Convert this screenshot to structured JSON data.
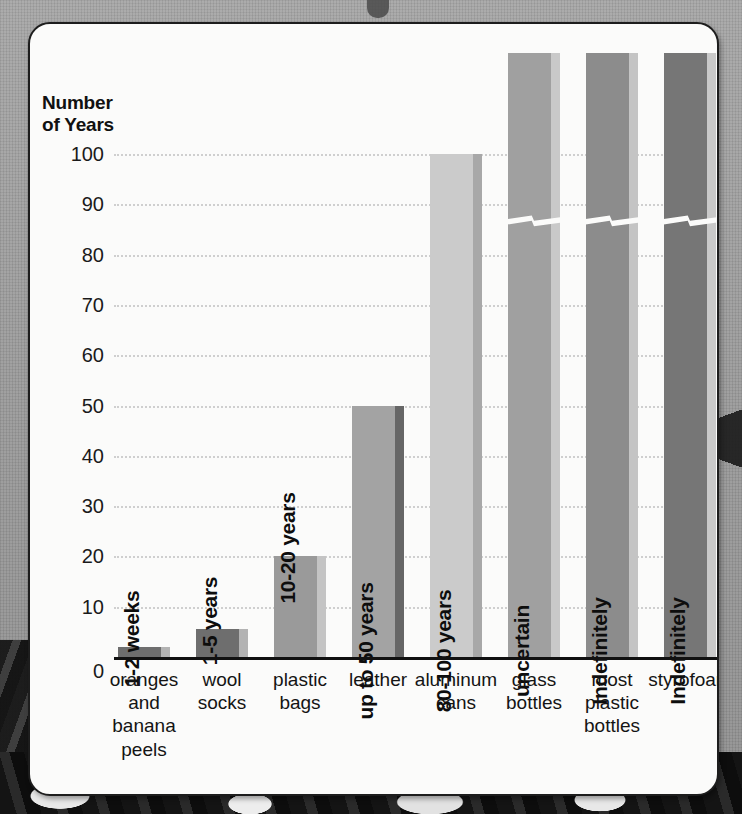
{
  "chart_data": {
    "type": "bar",
    "title": "",
    "ylabel": "Number of Years",
    "xlabel": "",
    "ylim": [
      0,
      100
    ],
    "grid": true,
    "legend": "none",
    "yticks": [
      "100",
      "90",
      "80",
      "70",
      "60",
      "50",
      "40",
      "30",
      "20",
      "10",
      "0"
    ],
    "ytick_values": [
      100,
      90,
      80,
      70,
      60,
      50,
      40,
      30,
      20,
      10,
      0
    ],
    "categories": [
      "oranges and banana peels",
      "wool socks",
      "plastic bags",
      "leather",
      "aluminum cans",
      "glass bottles",
      "most plastic bottles",
      "styrofoam"
    ],
    "values": [
      2,
      5.5,
      20,
      50,
      100,
      120,
      120,
      120
    ],
    "data_labels": [
      "1-2 weeks",
      "1-5 years",
      "10-20 years",
      "up to 50 years",
      "80-100 years",
      "uncertain",
      "Indefinitely",
      "Indefinitely"
    ],
    "axis_break_note": "glass bottles, most plastic bottles and styrofoam bars are drawn with an axis break near 85 years and run off the top of the plot"
  },
  "axis": {
    "title_line1": "Number",
    "title_line2": "of Years"
  },
  "bars": [
    {
      "name": "oranges-and-banana-peels",
      "label": "1-2 weeks",
      "value": 2,
      "color": "#6e6e6e",
      "edge_color": "#b3b3b3",
      "broken": false,
      "label_outside": true,
      "x": 88,
      "width": 52
    },
    {
      "name": "wool-socks",
      "label": "1-5 years",
      "value": 5.5,
      "color": "#6e6e6e",
      "edge_color": "#b3b3b3",
      "broken": false,
      "label_outside": true,
      "x": 166,
      "width": 52
    },
    {
      "name": "plastic-bags",
      "label": "10-20 years",
      "value": 20,
      "color": "#9a9a9a",
      "edge_color": "#c4c4c4",
      "broken": false,
      "label_outside": true,
      "x": 244,
      "width": 52
    },
    {
      "name": "leather",
      "label": "up to 50 years",
      "value": 50,
      "color": "#a3a3a3",
      "edge_color": "#666666",
      "broken": false,
      "label_outside": false,
      "x": 322,
      "width": 52
    },
    {
      "name": "aluminum-cans",
      "label": "80-100 years",
      "value": 100,
      "color": "#cbcbcb",
      "edge_color": "#a8a8a8",
      "broken": false,
      "label_outside": false,
      "x": 400,
      "width": 52
    },
    {
      "name": "glass-bottles",
      "label": "uncertain",
      "value": 120,
      "color": "#a0a0a0",
      "edge_color": "#c9c9c9",
      "broken": true,
      "label_outside": false,
      "x": 478,
      "width": 52
    },
    {
      "name": "most-plastic-bottles",
      "label": "Indefinitely",
      "value": 120,
      "color": "#8c8c8c",
      "edge_color": "#c4c4c4",
      "broken": true,
      "label_outside": false,
      "x": 556,
      "width": 52
    },
    {
      "name": "styrofoam",
      "label": "Indefinitely",
      "value": 120,
      "color": "#767676",
      "edge_color": "#c9c9c9",
      "broken": true,
      "label_outside": false,
      "x": 634,
      "width": 52
    }
  ],
  "xlabels": [
    {
      "name": "oranges-and-banana-peels",
      "lines": [
        "oranges",
        "and",
        "banana",
        "peels"
      ]
    },
    {
      "name": "wool-socks",
      "lines": [
        "wool",
        "socks"
      ]
    },
    {
      "name": "plastic-bags",
      "lines": [
        "plastic",
        "bags"
      ]
    },
    {
      "name": "leather",
      "lines": [
        "leather"
      ]
    },
    {
      "name": "aluminum-cans",
      "lines": [
        "aluminum",
        "cans"
      ]
    },
    {
      "name": "glass-bottles",
      "lines": [
        "glass",
        "bottles"
      ]
    },
    {
      "name": "most-plastic-bottles",
      "lines": [
        "most",
        "plastic",
        "bottles"
      ]
    },
    {
      "name": "styrofoam",
      "lines": [
        "styrofoam"
      ]
    }
  ],
  "colors": {
    "panel_background": "#fbfbfa",
    "panel_border": "#1d1d1d",
    "page_background": "#9d9d9d",
    "gridline": "#cfcfcf",
    "axis_line": "#111111",
    "text": "#141414"
  }
}
